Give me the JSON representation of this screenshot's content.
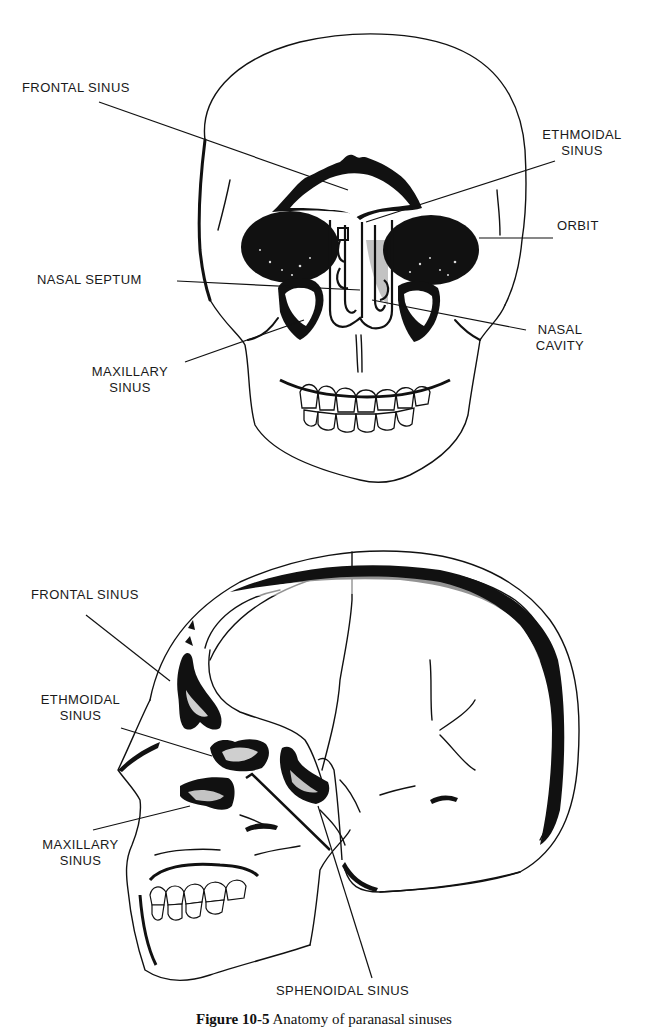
{
  "figure": {
    "caption_number": "Figure 10-5",
    "caption_text": "Anatomy of paranasal sinuses",
    "colors": {
      "ink": "#111111",
      "paper": "#ffffff",
      "label": "#1a1a1a"
    }
  },
  "frontal_view": {
    "labels": {
      "frontal_sinus": "FRONTAL SINUS",
      "ethmoidal_sinus_line1": "ETHMOIDAL",
      "ethmoidal_sinus_line2": "SINUS",
      "orbit": "ORBIT",
      "nasal_septum": "NASAL SEPTUM",
      "nasal_cavity_line1": "NASAL",
      "nasal_cavity_line2": "CAVITY",
      "maxillary_sinus_line1": "MAXILLARY",
      "maxillary_sinus_line2": "SINUS"
    }
  },
  "lateral_view": {
    "labels": {
      "frontal_sinus": "FRONTAL SINUS",
      "ethmoidal_sinus_line1": "ETHMOIDAL",
      "ethmoidal_sinus_line2": "SINUS",
      "maxillary_sinus_line1": "MAXILLARY",
      "maxillary_sinus_line2": "SINUS",
      "sphenoidal_sinus": "SPHENOIDAL SINUS"
    }
  }
}
